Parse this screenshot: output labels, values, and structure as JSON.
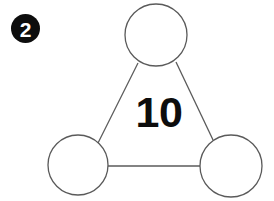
{
  "figure": {
    "type": "triangle-node-diagram",
    "background_color": "#ffffff",
    "problem_badge": {
      "label": "2",
      "shape": "filled-circle",
      "fill_color": "#0d0d0d",
      "text_color": "#ffffff",
      "cx": 25.5,
      "cy": 28.5,
      "r": 14.5
    },
    "center_label": {
      "text": "10",
      "color": "#0d0d0d",
      "x": 159,
      "y": 112
    },
    "stroke_color": "#5a5a5a",
    "stroke_width": 1.3,
    "nodes": [
      {
        "name": "top-node",
        "label": "",
        "cx": 156,
        "cy": 35,
        "r": 31
      },
      {
        "name": "bottom-left-node",
        "label": "",
        "cx": 78,
        "cy": 165,
        "r": 30
      },
      {
        "name": "bottom-right-node",
        "label": "",
        "cx": 231,
        "cy": 166,
        "r": 31
      }
    ],
    "edges": [
      {
        "name": "edge-top-to-bottom-left",
        "x1": 138,
        "y1": 63,
        "x2": 98,
        "y2": 143
      },
      {
        "name": "edge-top-to-bottom-right",
        "x1": 176,
        "y1": 62,
        "x2": 214,
        "y2": 142
      },
      {
        "name": "edge-bottom-left-to-bottom-right",
        "x1": 108,
        "y1": 166,
        "x2": 200,
        "y2": 166
      }
    ]
  }
}
